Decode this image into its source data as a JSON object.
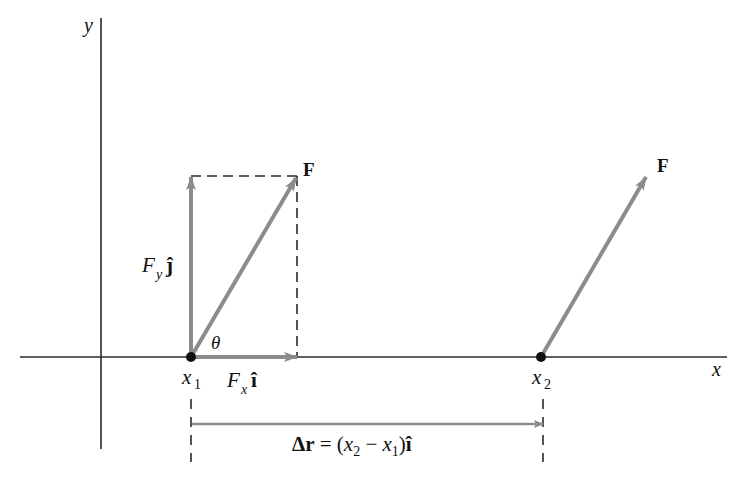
{
  "diagram": {
    "colors": {
      "axis": "#2a2a2a",
      "vector": "#8c8c8c",
      "dashed": "#2a2a2a",
      "point": "#111111",
      "text": "#111111"
    },
    "axes": {
      "x_label": "x",
      "y_label": "y"
    },
    "points": [
      {
        "id": "x1",
        "label": "x",
        "subscript": "1"
      },
      {
        "id": "x2",
        "label": "x",
        "subscript": "2"
      }
    ],
    "vectors": {
      "force_at_x1": {
        "label": "F"
      },
      "force_at_x2": {
        "label": "F"
      },
      "fy_component": {
        "label_main": "F",
        "label_sub": "y",
        "unit_vector": "ĵ"
      },
      "fx_component": {
        "label_main": "F",
        "label_sub": "x",
        "unit_vector": "î"
      },
      "displacement": {
        "label_prefix": "Δr",
        "label_equals": " = (",
        "x2_main": "x",
        "x2_sub": "2",
        "minus": " − ",
        "x1_main": "x",
        "x1_sub": "1",
        "close": ")",
        "unit_vector": "î"
      }
    },
    "angle": {
      "label": "θ"
    }
  }
}
